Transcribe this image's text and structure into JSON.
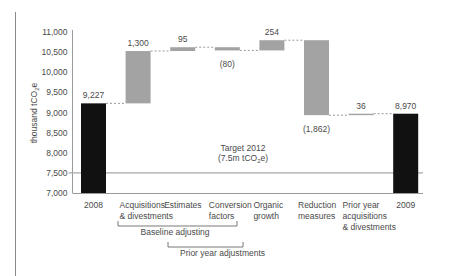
{
  "chart_data": {
    "type": "bar",
    "subtype": "waterfall",
    "title": "",
    "xlabel": "",
    "ylabel": "thousand tCO2e",
    "ylabel_parts": {
      "pre": "thousand tCO",
      "sub": "2",
      "post": "e"
    },
    "ylim": [
      7000,
      11000
    ],
    "yticks": [
      7000,
      7500,
      8000,
      8500,
      9000,
      9500,
      10000,
      10500,
      11000
    ],
    "ytick_labels": [
      "7,000",
      "7,500",
      "8,000",
      "8,500",
      "9,000",
      "9,500",
      "10,000",
      "10,500",
      "11,000"
    ],
    "grid": false,
    "categories": [
      {
        "lines": [
          "2008"
        ]
      },
      {
        "lines": [
          "Acquisitions",
          "& divestments"
        ]
      },
      {
        "lines": [
          "Estimates"
        ]
      },
      {
        "lines": [
          "Conversion",
          "factors"
        ]
      },
      {
        "lines": [
          "Organic",
          "growth"
        ]
      },
      {
        "lines": [
          "Reduction",
          "measures"
        ]
      },
      {
        "lines": [
          "Prior year",
          "acquisitions",
          "& divestments"
        ]
      },
      {
        "lines": [
          "2009"
        ]
      }
    ],
    "bars": [
      {
        "kind": "total",
        "value": 9227,
        "label": "9,227",
        "label_pos": "above"
      },
      {
        "kind": "delta",
        "value": 1300,
        "label": "1,300",
        "label_pos": "above"
      },
      {
        "kind": "delta",
        "value": 95,
        "label": "95",
        "label_pos": "above"
      },
      {
        "kind": "delta",
        "value": -80,
        "label": "(80)",
        "label_pos": "below"
      },
      {
        "kind": "delta",
        "value": 254,
        "label": "254",
        "label_pos": "above"
      },
      {
        "kind": "delta",
        "value": -1862,
        "label": "(1,862)",
        "label_pos": "below"
      },
      {
        "kind": "delta",
        "value": 36,
        "label": "36",
        "label_pos": "above"
      },
      {
        "kind": "total",
        "value": 8970,
        "label": "8,970",
        "label_pos": "above"
      }
    ],
    "target": {
      "value": 7500,
      "label_line1": "Target 2012",
      "label_line2_parts": {
        "pre": "(7.5m tCO",
        "sub": "2",
        "post": "e)"
      }
    },
    "brackets": [
      {
        "label": "Baseline adjusting",
        "from_category": 1,
        "to_category": 3
      },
      {
        "label": "Prior year adjustments",
        "from_category": 2,
        "to_category": 3
      }
    ],
    "colors": {
      "total": "#111111",
      "delta": "#a3a3a3",
      "text": "#4a4a4a",
      "axis": "#9a9a9a",
      "target_line": "#a8a8a8",
      "connector": "#9a9a9a"
    }
  }
}
